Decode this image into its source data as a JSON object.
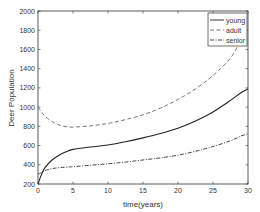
{
  "chart_data": {
    "type": "line",
    "title": "",
    "xlabel": "time(years)",
    "ylabel": "Deer Population",
    "xlim": [
      0,
      30
    ],
    "ylim": [
      200,
      2000
    ],
    "xticks": [
      0,
      5,
      10,
      15,
      20,
      25,
      30
    ],
    "yticks": [
      200,
      400,
      600,
      800,
      1000,
      1200,
      1400,
      1600,
      1800,
      2000
    ],
    "grid": false,
    "legend_position": "upper right",
    "x": [
      0,
      0.5,
      1,
      2,
      3,
      4,
      5,
      7.5,
      10,
      12.5,
      15,
      17.5,
      20,
      22.5,
      25,
      27.5,
      29,
      30
    ],
    "series": [
      {
        "name": "young",
        "style": "solid",
        "values": [
          200,
          300,
          370,
          450,
          500,
          535,
          560,
          585,
          605,
          640,
          680,
          725,
          780,
          855,
          950,
          1070,
          1150,
          1190
        ]
      },
      {
        "name": "adult",
        "style": "dashed",
        "values": [
          1000,
          950,
          905,
          850,
          815,
          797,
          792,
          805,
          830,
          870,
          920,
          990,
          1080,
          1190,
          1330,
          1510,
          1700,
          1810
        ]
      },
      {
        "name": "senior",
        "style": "dashdot",
        "values": [
          300,
          320,
          340,
          360,
          370,
          375,
          380,
          395,
          410,
          428,
          450,
          472,
          500,
          540,
          590,
          650,
          700,
          720
        ]
      }
    ]
  },
  "labels": {
    "xlabel": "time(years)",
    "ylabel": "Deer Population",
    "legend": [
      "young",
      "adult",
      "senior"
    ]
  }
}
